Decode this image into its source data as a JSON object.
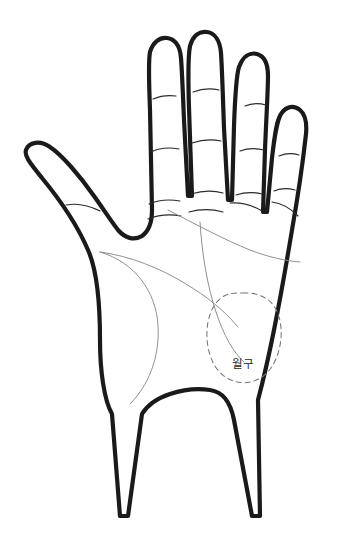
{
  "figure": {
    "background_color": "#ffffff",
    "outline_color": "#1a1a1a",
    "crease_color": "#2b2b2b",
    "palm_line_color": "#8a8a8a",
    "region_outline_color": "#777777",
    "label_color": "#2a2a2a"
  },
  "regions": [
    {
      "id": "mount-of-luna",
      "label": "월구",
      "style": "dashed-oval",
      "center_x": 243,
      "center_y": 336
    }
  ],
  "fingers": [
    {
      "name": "thumb",
      "crease_count": 1
    },
    {
      "name": "index",
      "crease_count": 3
    },
    {
      "name": "middle",
      "crease_count": 3
    },
    {
      "name": "ring",
      "crease_count": 3
    },
    {
      "name": "pinky",
      "crease_count": 2
    }
  ],
  "palm_lines": [
    {
      "name": "heart-line"
    },
    {
      "name": "head-line"
    },
    {
      "name": "life-line"
    },
    {
      "name": "fate-line"
    }
  ]
}
